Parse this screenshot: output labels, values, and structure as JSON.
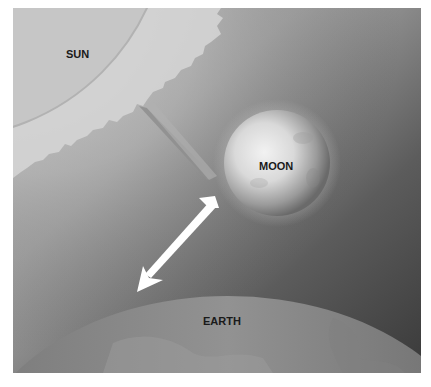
{
  "diagram": {
    "type": "solar-eclipse-illustration",
    "labels": {
      "sun": "SUN",
      "moon": "MOON",
      "earth": "EARTH"
    },
    "arrows": [
      {
        "from": "sun",
        "to": "moon",
        "style": "gray",
        "meaning": "sunlight toward moon"
      },
      {
        "from": "moon",
        "to": "earth",
        "style": "white",
        "meaning": "moon shadow/light toward earth"
      }
    ],
    "colors": {
      "background_light": "#b8b8b8",
      "background_dark": "#3c3c3c",
      "sun": "#c4c4c4",
      "corona": "#d8d8d8",
      "moon_light": "#e6e6e6",
      "moon_dark": "#7a7a7a",
      "earth": "#8a8a8a",
      "arrow_white": "#ffffff",
      "arrow_gray": "#8e8e8e",
      "label": "#1a1a1a"
    }
  }
}
